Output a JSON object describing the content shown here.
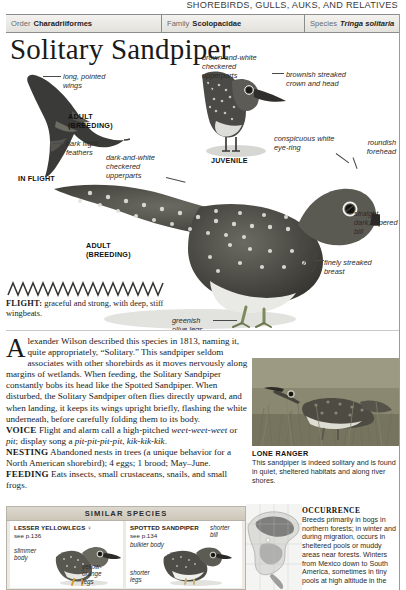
{
  "running_head": "SHOREBIRDS, GULLS, AUKS, AND RELATIVES",
  "taxonomy": {
    "order_label": "Order",
    "order_value": "Charadriiformes",
    "family_label": "Family",
    "family_value": "Scolopacidae",
    "species_label": "Species",
    "species_value": "Tringa solitaria"
  },
  "title": "Solitary Sandpiper",
  "plate": {
    "annotations": [
      {
        "id": "long-pointed-wings",
        "text": "long, pointed wings"
      },
      {
        "id": "dark-flight-feathers",
        "text": "dark flight feathers"
      },
      {
        "id": "dark-and-white-checkered-upperparts",
        "text": "dark-and-white checkered upperparts"
      },
      {
        "id": "brown-and-white-checkered-upperparts",
        "text": "brown-and-white checkered upperparts"
      },
      {
        "id": "brownish-streaked-crown-and-head",
        "text": "brownish streaked crown and head"
      },
      {
        "id": "conspicuous-white-eye-ring",
        "text": "conspicuous white eye-ring"
      },
      {
        "id": "roundish-forehead",
        "text": "roundish forehead"
      },
      {
        "id": "straight-dark-tapered-bill",
        "text": "straight, dark, tapered bill"
      },
      {
        "id": "finely-streaked-breast",
        "text": "finely streaked breast"
      },
      {
        "id": "greenish-olive-legs",
        "text": "greenish olive legs"
      }
    ],
    "captions": [
      {
        "id": "in-flight",
        "line1": "IN FLIGHT"
      },
      {
        "id": "adult-breeding-flight",
        "line1": "ADULT",
        "line2": "(BREEDING)"
      },
      {
        "id": "juvenile",
        "line1": "JUVENILE"
      },
      {
        "id": "adult-breeding-main",
        "line1": "ADULT",
        "line2": "(BREEDING)"
      }
    ]
  },
  "flight": {
    "label": "FLIGHT:",
    "text": " graceful and strong, with deep, stiff wingbeats."
  },
  "body": {
    "dropcap": "A",
    "lead": "lexander Wilson described this species in 1813, naming it, quite appropriately, “Solitary.” This sandpiper seldom associates with other shorebirds as it moves nervously along margins of wetlands. When feeding, the Solitary Sandpiper constantly bobs its head like the Spotted Sandpiper. When disturbed, the Solitary Sandpiper often flies directly upward, and when landing, it keeps its wings upright briefly, flashing the white underneath, before carefully folding them to its body.",
    "voice_label": "VOICE",
    "voice_text_a": " Flight and alarm call a high-pitched ",
    "voice_call_a": "weet-weet-weet",
    "voice_text_b": " or ",
    "voice_call_b": "pit",
    "voice_text_c": "; display song a ",
    "voice_call_c": "pit-pit-pit-pit",
    "voice_text_d": ", ",
    "voice_call_d": "kik-kik-kik",
    "voice_text_e": ".",
    "nesting_label": "NESTING",
    "nesting_text": " Abandoned nests in trees (a unique behavior for a North American shorebird); 4 eggs; 1 brood; May–June.",
    "feeding_label": "FEEDING",
    "feeding_text": " Eats insects, small crustaceans, snails, and small frogs."
  },
  "similar_species": {
    "header": "SIMILAR SPECIES",
    "items": [
      {
        "name": "LESSER YELLOWLEGS",
        "symbol": "♀",
        "page": "see p.136",
        "annos": [
          {
            "id": "slimmer-body",
            "text": "slimmer body"
          },
          {
            "id": "yellow-orange-legs",
            "text": "yellow-orange legs"
          }
        ]
      },
      {
        "name": "SPOTTED SANDPIPER",
        "symbol": "",
        "page": "see p.134",
        "annos": [
          {
            "id": "bulkier-body",
            "text": "bulkier body"
          },
          {
            "id": "shorter-bill",
            "text": "shorter bill"
          },
          {
            "id": "shorter-legs",
            "text": "shorter legs"
          }
        ]
      }
    ]
  },
  "photo": {
    "caption_title": "LONE RANGER",
    "caption_text": "This sandpiper is indeed solitary and is found in quiet, sheltered habitats and along river shores."
  },
  "occurrence": {
    "heading": "OCCURRENCE",
    "text": "Breeds primarily in bogs in northern forests; in winter and during migration, occurs in sheltered pools or muddy areas near forests. Winters from Mexico down to South America, sometimes in tiny pools at high altitude in the"
  },
  "colors": {
    "rule": "#8c8c8c",
    "bar_top": "#f3f2ef",
    "bar_bottom": "#e3e1dc",
    "similar_bg": "#edeae3",
    "ink": "#1a1a1a",
    "range_breed": "#6e6e6e",
    "range_winter": "#9d9d9d"
  }
}
